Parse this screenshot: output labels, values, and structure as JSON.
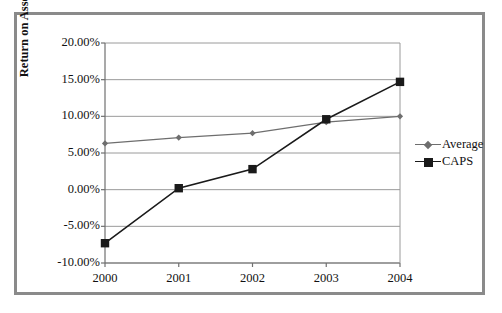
{
  "chart_data": {
    "type": "line",
    "title": "",
    "xlabel": "",
    "ylabel": "Return on Assets",
    "categories": [
      "2000",
      "2001",
      "2002",
      "2003",
      "2004"
    ],
    "x": [
      2000,
      2001,
      2002,
      2003,
      2004
    ],
    "ylim": [
      -10,
      20
    ],
    "yticks": [
      20,
      15,
      10,
      5,
      0,
      -5,
      -10
    ],
    "ytick_labels": [
      "20.00%",
      "15.00%",
      "10.00%",
      "5.00%",
      "0.00%",
      "-5.00%",
      "-10.00%"
    ],
    "grid": true,
    "legend_position": "right",
    "series": [
      {
        "name": "Average",
        "marker": "diamond",
        "color": "#6e6e6e",
        "values": [
          6.3,
          7.1,
          7.7,
          9.2,
          10.0
        ]
      },
      {
        "name": "CAPS",
        "marker": "square",
        "color": "#1a1a1a",
        "values": [
          -7.3,
          0.2,
          2.8,
          9.6,
          14.7
        ]
      }
    ]
  },
  "axes": {
    "y_title": "Return on Assets",
    "y_ticks": [
      "20.00%",
      "15.00%",
      "10.00%",
      "5.00%",
      "0.00%",
      "-5.00%",
      "-10.00%"
    ],
    "x_ticks": [
      "2000",
      "2001",
      "2002",
      "2003",
      "2004"
    ]
  },
  "legend": {
    "items": [
      {
        "label": "Average",
        "marker": "diamond-marker",
        "color": "#6e6e6e"
      },
      {
        "label": "CAPS",
        "marker": "square-marker",
        "color": "#1a1a1a"
      }
    ]
  },
  "style": {
    "frame_border": "#8a8a8a",
    "gridline": "#9a9a9a",
    "axis": "#707070",
    "background": "#ffffff"
  }
}
